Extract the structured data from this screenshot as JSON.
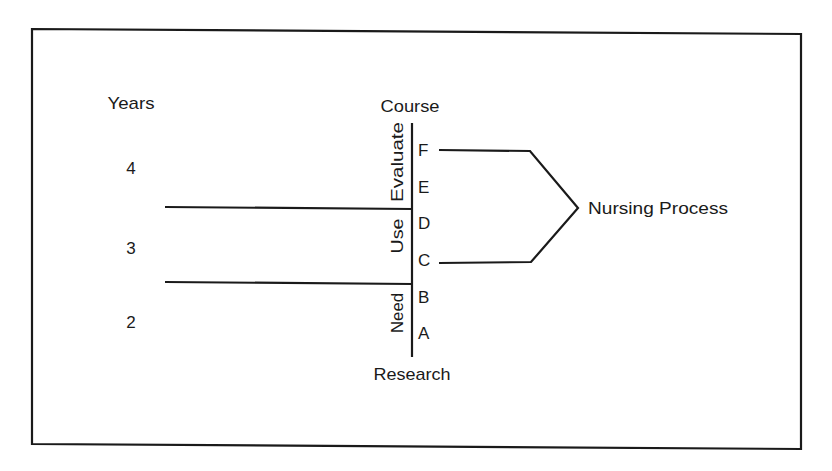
{
  "diagram": {
    "years_label": "Years",
    "years": [
      {
        "label": "4"
      },
      {
        "label": "3"
      },
      {
        "label": "2"
      }
    ],
    "axis_top_label": "Course",
    "axis_bottom_label": "Research",
    "phases": [
      {
        "label": "Evaluate"
      },
      {
        "label": "Use"
      },
      {
        "label": "Need"
      }
    ],
    "courses": [
      {
        "label": "F"
      },
      {
        "label": "E"
      },
      {
        "label": "D"
      },
      {
        "label": "C"
      },
      {
        "label": "B"
      },
      {
        "label": "A"
      }
    ],
    "bracket_label": "Nursing Process",
    "colors": {
      "ink": "#1a1a1a",
      "background": "#ffffff"
    }
  }
}
